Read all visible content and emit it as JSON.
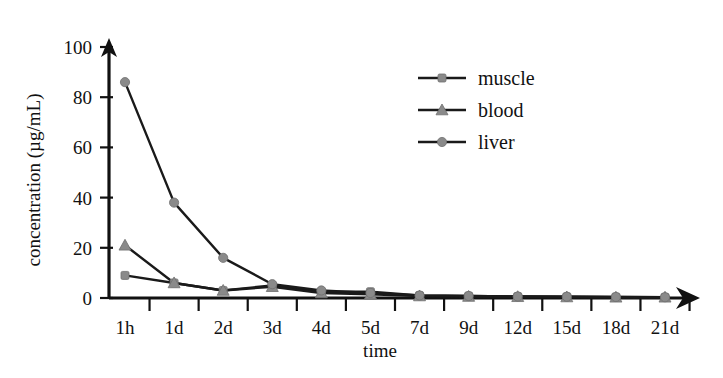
{
  "chart_data": {
    "type": "line",
    "title": "",
    "xlabel": "time",
    "ylabel": "concentration (µg/mL)",
    "categories": [
      "1h",
      "1d",
      "2d",
      "3d",
      "4d",
      "5d",
      "7d",
      "9d",
      "12d",
      "15d",
      "18d",
      "21d"
    ],
    "yticks": [
      0,
      20,
      40,
      60,
      80,
      100
    ],
    "ylim": [
      0,
      100
    ],
    "grid": false,
    "legend_position": "upper right",
    "series": [
      {
        "name": "muscle",
        "marker": "circle-small",
        "color": "#8a8a8a",
        "values": [
          9,
          6,
          3,
          5,
          2.5,
          2.5,
          1,
          0.8,
          0.6,
          0.5,
          0.4,
          0.3
        ]
      },
      {
        "name": "blood",
        "marker": "triangle",
        "color": "#8a8a8a",
        "values": [
          21,
          6,
          3,
          4.5,
          2,
          1.5,
          0.8,
          0.6,
          0.5,
          0.4,
          0.3,
          0.3
        ]
      },
      {
        "name": "liver",
        "marker": "circle",
        "color": "#8a8a8a",
        "values": [
          86,
          38,
          16,
          5.5,
          3,
          2,
          1,
          0.8,
          0.6,
          0.5,
          0.4,
          0.3
        ]
      }
    ]
  },
  "axis": {
    "y_title": "concentration (µg/mL)",
    "x_title": "time",
    "y_tick_labels": [
      "0",
      "20",
      "40",
      "60",
      "80",
      "100"
    ],
    "x_tick_labels": [
      "1h",
      "1d",
      "2d",
      "3d",
      "4d",
      "5d",
      "7d",
      "9d",
      "12d",
      "15d",
      "18d",
      "21d"
    ]
  },
  "legend": {
    "items": [
      {
        "label": "muscle"
      },
      {
        "label": "blood"
      },
      {
        "label": "liver"
      }
    ]
  }
}
